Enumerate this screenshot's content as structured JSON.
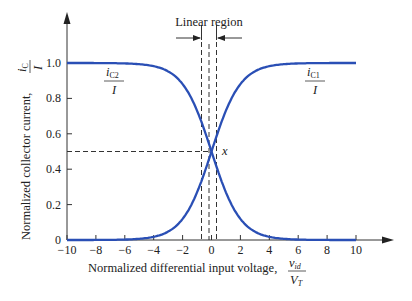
{
  "chart_data": {
    "type": "line",
    "title": "",
    "xlabel": "Normalized differential input voltage, v_id / V_T",
    "ylabel": "Normalized collector current, i_C / I",
    "x_ticks": [
      -10,
      -8,
      -6,
      -4,
      -2,
      0,
      2,
      4,
      6,
      8,
      10
    ],
    "y_ticks": [
      0,
      0.2,
      0.4,
      0.6,
      0.8,
      1.0
    ],
    "xlim": [
      -10,
      10
    ],
    "ylim": [
      0,
      1.0
    ],
    "grid": false,
    "series": [
      {
        "name": "i_C1 / I",
        "function": "1/(1+exp(-x))",
        "x": [
          -10,
          -6,
          -4,
          -2,
          -1,
          0,
          1,
          2,
          4,
          6,
          10
        ],
        "values": [
          0.0,
          0.0,
          0.02,
          0.12,
          0.27,
          0.5,
          0.73,
          0.88,
          0.98,
          1.0,
          1.0
        ]
      },
      {
        "name": "i_C2 / I",
        "function": "1/(1+exp(x))",
        "x": [
          -10,
          -6,
          -4,
          -2,
          -1,
          0,
          1,
          2,
          4,
          6,
          10
        ],
        "values": [
          1.0,
          1.0,
          0.98,
          0.88,
          0.73,
          0.5,
          0.27,
          0.12,
          0.02,
          0.0,
          0.0
        ]
      }
    ],
    "annotations": [
      {
        "text": "Linear region",
        "x_range": [
          -0.5,
          0.5
        ]
      },
      {
        "text": "x",
        "at": [
          0,
          0.5
        ]
      }
    ],
    "line_color": "#2a4fb5"
  },
  "labels": {
    "x_axis_main": "Normalized differential input voltage,",
    "x_axis_frac_num": "v",
    "x_axis_frac_num_sub": "id",
    "x_axis_frac_den": "V",
    "x_axis_frac_den_sub": "T",
    "y_axis_main": "Normalized collector current,",
    "y_axis_frac_num": "i",
    "y_axis_frac_num_sub": "C",
    "y_axis_frac_den": "I",
    "linear_region": "Linear region",
    "point_x": "x",
    "ic2_num": "i",
    "ic2_sub": "C2",
    "ic2_den": "I",
    "ic1_num": "i",
    "ic1_sub": "C1",
    "ic1_den": "I"
  },
  "ticks": {
    "x": [
      "−10",
      "−8",
      "−6",
      "−4",
      "−2",
      "0",
      "2",
      "4",
      "6",
      "8",
      "10"
    ],
    "y": [
      "0",
      "0.2",
      "0.4",
      "0.6",
      "0.8",
      "1.0"
    ]
  }
}
